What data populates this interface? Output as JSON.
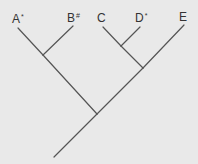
{
  "diagram": {
    "type": "cladogram",
    "colors": {
      "background": "#e9e9e9",
      "branch": "#555555",
      "label": "#333333"
    },
    "taxa": [
      {
        "id": "A",
        "label": "A",
        "mark": "*",
        "x": 12,
        "y": 13
      },
      {
        "id": "B",
        "label": "B",
        "mark": "#",
        "x": 67,
        "y": 12
      },
      {
        "id": "C",
        "label": "C",
        "mark": "",
        "x": 97,
        "y": 12
      },
      {
        "id": "D",
        "label": "D",
        "mark": "*",
        "x": 135,
        "y": 12
      },
      {
        "id": "E",
        "label": "E",
        "mark": "",
        "x": 179,
        "y": 11
      }
    ],
    "topology": "((A,B),((C,D),E))"
  }
}
